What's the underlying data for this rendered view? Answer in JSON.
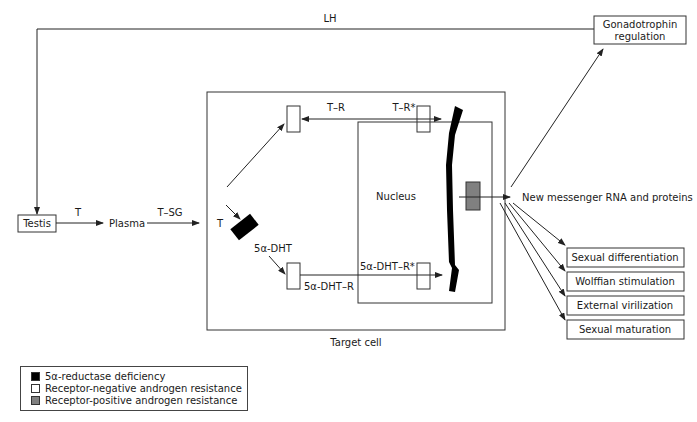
{
  "diagram": {
    "labels": {
      "lh": "LH",
      "gonadotrophin_line1": "Gonadotrophin",
      "gonadotrophin_line2": "regulation",
      "testis": "Testis",
      "t_arrow": "T",
      "plasma": "Plasma",
      "t_sg": "T–SG",
      "t_cell": "T",
      "t_r": "T–R",
      "t_r_star": "T–R*",
      "nucleus": "Nucleus",
      "dht": "5α-DHT",
      "dht_r": "5α-DHT–R",
      "dht_r_star": "5α-DHT–R*",
      "target_cell": "Target cell",
      "new_rna": "New messenger RNA and proteins"
    },
    "outcomes": [
      "Sexual differentiation",
      "Wolffian stimulation",
      "External virilization",
      "Sexual maturation"
    ]
  },
  "legend": {
    "items": [
      {
        "label": "5α-reductase deficiency",
        "color": "#000000"
      },
      {
        "label": "Receptor-negative androgen resistance",
        "color": "#ffffff"
      },
      {
        "label": "Receptor-positive androgen resistance",
        "color": "#808080"
      }
    ]
  }
}
